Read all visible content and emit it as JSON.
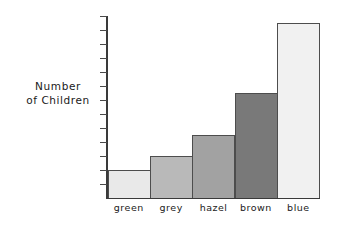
{
  "chart_data": {
    "type": "bar",
    "title": "",
    "xlabel": "",
    "ylabel": "Number of Children",
    "ylabel_line1": "Number",
    "ylabel_line2": "of Children",
    "categories": [
      "green",
      "grey",
      "hazel",
      "brown",
      "blue"
    ],
    "values": [
      2,
      3,
      4.5,
      7.5,
      12.5
    ],
    "ylim": [
      0,
      13
    ],
    "y_tick_count": 13,
    "y_tick_labels": [],
    "grid": false,
    "legend": false,
    "bar_colors": [
      "#e9e9e9",
      "#b9b9b9",
      "#a2a2a2",
      "#797979",
      "#f1f1f1"
    ],
    "bar_edge_color": "#4d4d4d",
    "axis_color": "#3a3a3a"
  },
  "axis": {
    "y_label_line1": "Number",
    "y_label_line2": "of Children"
  }
}
